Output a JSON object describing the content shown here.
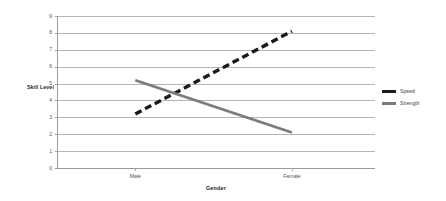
{
  "chart_data": {
    "type": "line",
    "title": "",
    "xlabel": "Gender",
    "ylabel": "Skill Level",
    "categories": [
      "Male",
      "Female"
    ],
    "ylim": [
      0,
      9
    ],
    "yticks": [
      "0",
      "1",
      "2",
      "3",
      "4",
      "5",
      "6",
      "7",
      "8",
      "9"
    ],
    "grid": true,
    "legend_position": "right",
    "series": [
      {
        "name": "Speed",
        "values": [
          3.2,
          8.1
        ],
        "color": "#1a1a1a",
        "style": "dashed",
        "width": 3.4
      },
      {
        "name": "Strength",
        "values": [
          5.2,
          2.1
        ],
        "color": "#7a7a7a",
        "style": "solid",
        "width": 2.6
      }
    ]
  },
  "legend": {
    "items": [
      {
        "label": "Speed"
      },
      {
        "label": "Strength"
      }
    ]
  }
}
